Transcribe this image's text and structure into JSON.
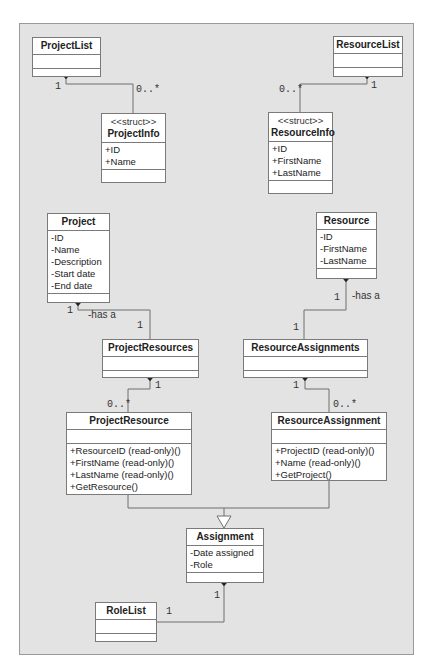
{
  "diagram": {
    "type": "UML class diagram",
    "classes": {
      "project_list": {
        "name": "ProjectList",
        "attributes": [],
        "operations": []
      },
      "resource_list": {
        "name": "ResourceList",
        "attributes": [],
        "operations": []
      },
      "project_info": {
        "stereotype": "<<struct>>",
        "name": "ProjectInfo",
        "attributes": [
          "+ID",
          "+Name"
        ],
        "operations": []
      },
      "resource_info": {
        "stereotype": "<<struct>>",
        "name": "ResourceInfo",
        "attributes": [
          "+ID",
          "+FirstName",
          "+LastName"
        ],
        "operations": []
      },
      "project": {
        "name": "Project",
        "attributes": [
          "-ID",
          "-Name",
          "-Description",
          "-Start date",
          "-End date"
        ],
        "operations": []
      },
      "resource": {
        "name": "Resource",
        "attributes": [
          "-ID",
          "-FirstName",
          "-LastName"
        ],
        "operations": []
      },
      "project_resources": {
        "name": "ProjectResources",
        "attributes": [],
        "operations": []
      },
      "resource_assignments": {
        "name": "ResourceAssignments",
        "attributes": [],
        "operations": []
      },
      "project_resource": {
        "name": "ProjectResource",
        "attributes": [],
        "operations": [
          "+ResourceID (read-only)()",
          "+FirstName (read-only)()",
          "+LastName (read-only)()",
          "+GetResource()"
        ]
      },
      "resource_assignment": {
        "name": "ResourceAssignment",
        "attributes": [],
        "operations": [
          "+ProjectID (read-only)()",
          "+Name (read-only)()",
          "+GetProject()"
        ]
      },
      "assignment": {
        "name": "Assignment",
        "attributes": [
          "-Date assigned",
          "-Role"
        ],
        "operations": []
      },
      "role_list": {
        "name": "RoleList",
        "attributes": [],
        "operations": []
      }
    },
    "relationships": [
      {
        "from": "ProjectList",
        "to": "ProjectInfo",
        "kind": "composition",
        "from_mult": "1",
        "to_mult": "0..*"
      },
      {
        "from": "ResourceList",
        "to": "ResourceInfo",
        "kind": "composition",
        "from_mult": "1",
        "to_mult": "0..*"
      },
      {
        "from": "Project",
        "to": "ProjectResources",
        "kind": "composition",
        "from_mult": "1",
        "to_mult": "1",
        "label": "-has a"
      },
      {
        "from": "Resource",
        "to": "ResourceAssignments",
        "kind": "composition",
        "from_mult": "1",
        "to_mult": "1",
        "label": "-has a"
      },
      {
        "from": "ProjectResources",
        "to": "ProjectResource",
        "kind": "composition",
        "from_mult": "1",
        "to_mult": "0..*"
      },
      {
        "from": "ResourceAssignments",
        "to": "ResourceAssignment",
        "kind": "composition",
        "from_mult": "1",
        "to_mult": "0..*"
      },
      {
        "from": "ProjectResource",
        "to": "Assignment",
        "kind": "generalization"
      },
      {
        "from": "ResourceAssignment",
        "to": "Assignment",
        "kind": "generalization"
      },
      {
        "from": "Assignment",
        "to": "RoleList",
        "kind": "composition",
        "from_mult": "1",
        "to_mult": "1"
      }
    ],
    "labels": {
      "one": "1",
      "zero_many": "0..*",
      "has_a": "-has a"
    },
    "colors": {
      "background": "#e3e3e3",
      "box_fill": "#ffffff",
      "line": "#6e6e6e"
    }
  }
}
